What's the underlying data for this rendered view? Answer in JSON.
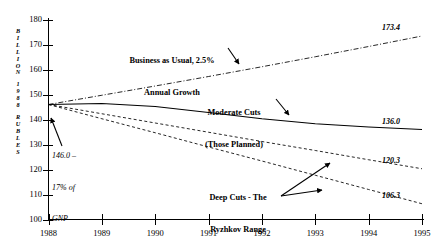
{
  "chart_data": {
    "type": "line",
    "title": "",
    "xlabel": "",
    "ylabel": "BILLION 1988 RUBLES",
    "xlim": [
      1988,
      1995
    ],
    "ylim": [
      100,
      180
    ],
    "ytick_labels": [
      "180",
      "170",
      "160",
      "150",
      "140",
      "130",
      "120",
      "110",
      "100"
    ],
    "ytick_values": [
      180,
      170,
      160,
      150,
      140,
      130,
      120,
      110,
      100
    ],
    "xtick_labels": [
      "1988",
      "1989",
      "1990",
      "1991",
      "1992",
      "1993",
      "1994",
      "1995"
    ],
    "xtick_values": [
      1988,
      1989,
      1990,
      1991,
      1992,
      1993,
      1994,
      1995
    ],
    "grid": false,
    "legend": "none",
    "x": [
      1988,
      1989,
      1990,
      1991,
      1992,
      1993,
      1994,
      1995
    ],
    "series": [
      {
        "name": "Business as Usual, 2.5% Annual Growth",
        "style": "dash-dot",
        "values": [
          146.0,
          149.7,
          153.4,
          157.2,
          161.1,
          165.1,
          169.2,
          173.4
        ],
        "end_label": "173.4"
      },
      {
        "name": "Moderate Cuts (Those Planned)",
        "style": "solid",
        "values": [
          146.0,
          146.4,
          145.2,
          142.8,
          140.3,
          138.3,
          137.0,
          136.0
        ],
        "end_label": "136.0"
      },
      {
        "name": "Deep Cuts - The Ryzhkov Range (upper)",
        "style": "dashed",
        "values": [
          146.0,
          142.3,
          138.6,
          134.9,
          131.2,
          127.6,
          123.9,
          120.3
        ],
        "end_label": "120.3"
      },
      {
        "name": "Deep Cuts - The Ryzhkov Range (lower)",
        "style": "dashed",
        "values": [
          146.0,
          140.3,
          134.7,
          129.0,
          123.4,
          117.7,
          112.0,
          106.3
        ],
        "end_label": "106.3"
      }
    ],
    "annotations": [
      {
        "id": "business-as-usual",
        "line1": "Business as Usual, 2.5%",
        "line2": "Annual Growth"
      },
      {
        "id": "moderate-cuts",
        "line1": "Moderate Cuts",
        "line2": "(Those Planned)"
      },
      {
        "id": "deep-cuts",
        "line1": "Deep Cuts - The",
        "line2": "Ryzhkov Range"
      },
      {
        "id": "origin-note",
        "line1": "146.0 –",
        "line2": "17% of",
        "line3": "GNP"
      }
    ],
    "colors": {
      "line": "#000000",
      "axis": "#000000",
      "background": "#ffffff"
    }
  },
  "axis_title_chars": [
    "B",
    "I",
    "L",
    "L",
    "I",
    "O",
    "N",
    "",
    "1",
    "9",
    "8",
    "8",
    "",
    "R",
    "U",
    "B",
    "L",
    "E",
    "S"
  ]
}
